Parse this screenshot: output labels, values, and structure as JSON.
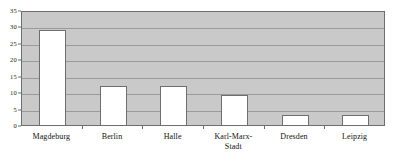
{
  "chart_data": {
    "type": "bar",
    "title": "",
    "subtitle": "",
    "xlabel": "",
    "ylabel": "",
    "categories": [
      "Magdeburg",
      "Berlin",
      "Halle",
      "Karl-Marx-\nStadt",
      "Dresden",
      "Leipzig"
    ],
    "values": [
      29,
      12,
      12,
      9,
      3,
      3
    ],
    "ylim": [
      0,
      35
    ],
    "ytick_step": 5,
    "yticks": [
      "0",
      "5",
      "10",
      "15",
      "20",
      "25",
      "30",
      "35"
    ],
    "ytick_values": [
      0,
      5,
      10,
      15,
      20,
      25,
      30,
      35
    ],
    "grid": true,
    "legend": "none",
    "colors": {
      "plot_background": "#c9c9c9",
      "bar_fill": "#ffffff",
      "bar_border": "#6e6e6e",
      "gridline": "#9a9a9a",
      "axis": "#6e6e6e",
      "text": "#111111",
      "page_background": "#ffffff"
    }
  }
}
